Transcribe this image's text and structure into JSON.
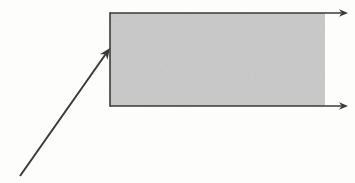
{
  "canvas": {
    "width": 355,
    "height": 183,
    "background_color": "#fdfdfc"
  },
  "chart_data": {
    "type": "diagram",
    "title": "",
    "subtitle": "",
    "xlabel": "",
    "ylabel": "",
    "legend": [],
    "annotations": [],
    "shapes": [
      {
        "name": "shaded-band",
        "kind": "rectangle",
        "fill_color": "#c9c9c9",
        "stroke_color": "#3a3a3a",
        "stroke_width": 1.6,
        "x": 110,
        "y": 13,
        "width": 215,
        "height": 93,
        "open_side": "right",
        "borders": [
          "left",
          "top",
          "bottom"
        ]
      },
      {
        "name": "top-ray",
        "kind": "arrow",
        "stroke_color": "#3a3a3a",
        "stroke_width": 1.6,
        "x1": 110,
        "y1": 13,
        "x2": 348,
        "y2": 13,
        "arrowhead_at": "end",
        "arrowhead_size": 9
      },
      {
        "name": "bottom-ray",
        "kind": "arrow",
        "stroke_color": "#3a3a3a",
        "stroke_width": 1.6,
        "x1": 110,
        "y1": 106,
        "x2": 348,
        "y2": 106,
        "arrowhead_at": "end",
        "arrowhead_size": 9
      },
      {
        "name": "incident-ray",
        "kind": "arrow",
        "stroke_color": "#3a3a3a",
        "stroke_width": 2.0,
        "x1": 20,
        "y1": 176,
        "x2": 110,
        "y2": 48,
        "arrowhead_at": "end",
        "arrowhead_size": 11
      },
      {
        "name": "left-edge",
        "kind": "line",
        "stroke_color": "#3a3a3a",
        "stroke_width": 1.6,
        "x1": 110,
        "y1": 13,
        "x2": 110,
        "y2": 106
      }
    ],
    "colors": {
      "band_fill": "#c9c9c9",
      "stroke": "#3a3a3a",
      "background": "#fdfdfc"
    }
  }
}
